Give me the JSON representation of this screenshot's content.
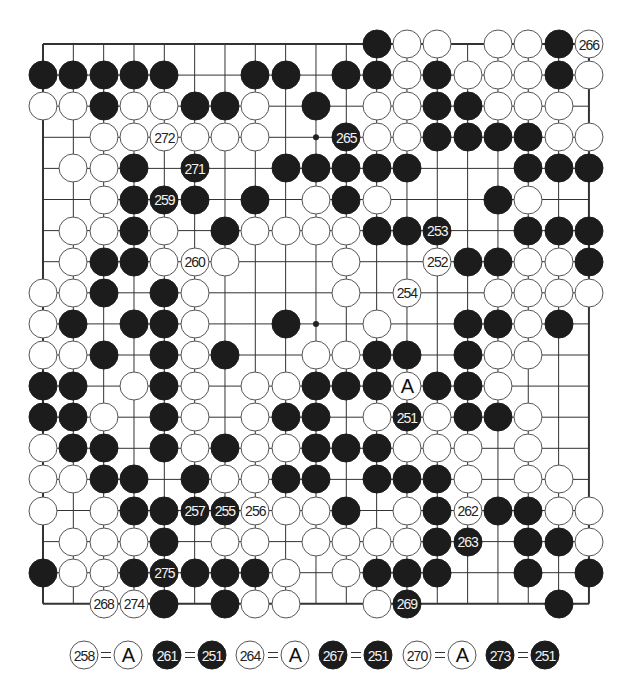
{
  "diagram": {
    "type": "go-board",
    "size": 19,
    "grid": {
      "left": 43,
      "top": 44,
      "dx": 30.33,
      "dy": 31.1
    },
    "colors": {
      "black": "#1c1c1c",
      "white": "#ffffff",
      "line": "#333333"
    },
    "hoshi": [
      [
        3,
        9
      ],
      [
        9,
        9
      ]
    ],
    "rows": [
      ". . . . . . . . . . . B W W . W W B W",
      "B B B B B . . B B . B B W B W W W B W",
      "W W B W W B B W . B . W W B B W W W .",
      ". . W W W W W W . . B W W B B B B W W",
      ". W W B . B . . B B B B B . . . B B B",
      ". . W B B B . B . W B W . . . B W . .",
      ". W W B W . B W W W W B B B . . B B B",
      ". W B B W W W . . . W . . W B B W W B",
      "W W B . B W . . . . W . W . . W W W W",
      "W B . B B W . . B . . W . . B B W B .",
      "W W B . B W B . . W W B B . B W W . .",
      "B B . W B W . W W B B B A B B W . . .",
      "B B W . B W . W B B . W B W B B W . .",
      "W B B . B W B W W B B B W W W . W . .",
      "W W B B . B W W B B . B B B W . W W .",
      "W . W B B B B W W W B . W B W B B W W",
      ". W W W B . W W . W W W W B B . B B W",
      "B W W B B B B B W . W B B B . . B . B",
      ". . W W B . B W W . . W B . . . . B ."
    ],
    "labels": [
      {
        "row": 0,
        "col": 18,
        "text": "266"
      },
      {
        "row": 3,
        "col": 4,
        "text": "272"
      },
      {
        "row": 3,
        "col": 10,
        "text": "265"
      },
      {
        "row": 4,
        "col": 5,
        "text": "271"
      },
      {
        "row": 5,
        "col": 4,
        "text": "259"
      },
      {
        "row": 6,
        "col": 13,
        "text": "253"
      },
      {
        "row": 7,
        "col": 5,
        "text": "260"
      },
      {
        "row": 7,
        "col": 13,
        "text": "252"
      },
      {
        "row": 8,
        "col": 12,
        "text": "254"
      },
      {
        "row": 11,
        "col": 12,
        "text": "A"
      },
      {
        "row": 12,
        "col": 12,
        "text": "251"
      },
      {
        "row": 15,
        "col": 5,
        "text": "257"
      },
      {
        "row": 15,
        "col": 6,
        "text": "255"
      },
      {
        "row": 15,
        "col": 7,
        "text": "256"
      },
      {
        "row": 15,
        "col": 14,
        "text": "262"
      },
      {
        "row": 16,
        "col": 14,
        "text": "263"
      },
      {
        "row": 17,
        "col": 4,
        "text": "275"
      },
      {
        "row": 18,
        "col": 2,
        "text": "268"
      },
      {
        "row": 18,
        "col": 3,
        "text": "274"
      },
      {
        "row": 18,
        "col": 12,
        "text": "269"
      }
    ]
  },
  "legend": [
    {
      "left": {
        "color": "W",
        "text": "258",
        "x": 84
      },
      "right": {
        "color": "A",
        "text": "A",
        "x": 128
      }
    },
    {
      "left": {
        "color": "B",
        "text": "261",
        "x": 167
      },
      "right": {
        "color": "B",
        "text": "251",
        "x": 212
      }
    },
    {
      "left": {
        "color": "W",
        "text": "264",
        "x": 250
      },
      "right": {
        "color": "A",
        "text": "A",
        "x": 295
      }
    },
    {
      "left": {
        "color": "B",
        "text": "267",
        "x": 333
      },
      "right": {
        "color": "B",
        "text": "251",
        "x": 378
      }
    },
    {
      "left": {
        "color": "W",
        "text": "270",
        "x": 417
      },
      "right": {
        "color": "A",
        "text": "A",
        "x": 462
      }
    },
    {
      "left": {
        "color": "B",
        "text": "273",
        "x": 500
      },
      "right": {
        "color": "B",
        "text": "251",
        "x": 545
      }
    }
  ]
}
